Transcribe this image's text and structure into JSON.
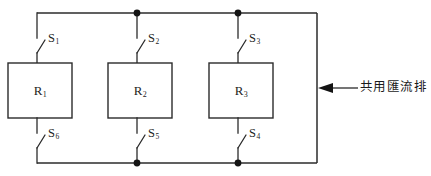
{
  "diagram": {
    "title": "共用匯流排",
    "type": "electrical-schematic",
    "branches": [
      {
        "id": "branch-1",
        "resistor": {
          "symbol": "R",
          "subscript": "1"
        },
        "top_switch": {
          "symbol": "S",
          "subscript": "1",
          "state": "open"
        },
        "bottom_switch": {
          "symbol": "S",
          "subscript": "6",
          "state": "open"
        }
      },
      {
        "id": "branch-2",
        "resistor": {
          "symbol": "R",
          "subscript": "2"
        },
        "top_switch": {
          "symbol": "S",
          "subscript": "2",
          "state": "open"
        },
        "bottom_switch": {
          "symbol": "S",
          "subscript": "5",
          "state": "open"
        }
      },
      {
        "id": "branch-3",
        "resistor": {
          "symbol": "R",
          "subscript": "3"
        },
        "top_switch": {
          "symbol": "S",
          "subscript": "3",
          "state": "open"
        },
        "bottom_switch": {
          "symbol": "S",
          "subscript": "4",
          "state": "open"
        }
      }
    ],
    "annotation": {
      "text": "共用匯流排",
      "arrow_direction": "left",
      "points_to": "right-vertical-bus-bar"
    },
    "caption": "",
    "colors": {
      "wire": "#2b2b2b",
      "node": "#141414",
      "background": "#ffffff",
      "text": "#1d1d1d"
    }
  }
}
